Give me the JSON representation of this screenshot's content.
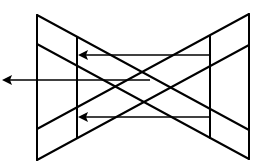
{
  "diagram": {
    "type": "geometric line diagram",
    "stroke_color": "#000000",
    "background_color": "#ffffff",
    "shapes": {
      "left_triangle": {
        "vertices": [
          [
            37,
            15
          ],
          [
            37,
            160
          ]
        ]
      },
      "right_triangle": {
        "vertices": [
          [
            249,
            14
          ],
          [
            249,
            159
          ]
        ]
      },
      "inner_verticals": [
        {
          "x": 77,
          "y1": 37,
          "y2": 138
        },
        {
          "x": 210,
          "y1": 36,
          "y2": 137
        }
      ]
    },
    "arrows": [
      {
        "name": "top-arrow",
        "from": [
          210,
          55
        ],
        "to": [
          77,
          55
        ],
        "direction": "left"
      },
      {
        "name": "middle-arrow",
        "from": [
          150,
          80
        ],
        "to": [
          2,
          80
        ],
        "direction": "left"
      },
      {
        "name": "bottom-arrow",
        "from": [
          210,
          117
        ],
        "to": [
          77,
          117
        ],
        "direction": "left"
      }
    ],
    "labels": []
  }
}
